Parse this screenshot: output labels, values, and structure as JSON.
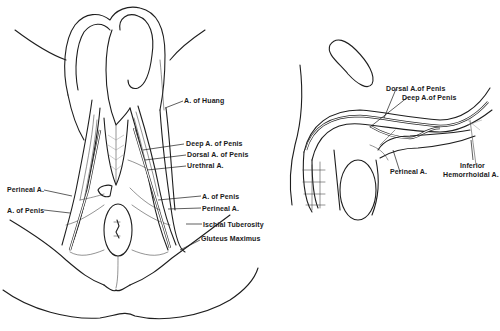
{
  "figure": {
    "background": "#ffffff",
    "ink_color": "#1e1e1e",
    "left_panel": {
      "view": "perineal view",
      "labels": [
        {
          "id": "a-of-huang",
          "text": "A. of Huang"
        },
        {
          "id": "deep-a-of-penis",
          "text": "Deep A. of Penis"
        },
        {
          "id": "dorsal-a-of-penis",
          "text": "Dorsal A. of Penis"
        },
        {
          "id": "urethral-a",
          "text": "Urethral A."
        },
        {
          "id": "perineal-a-left",
          "text": "Perineal A."
        },
        {
          "id": "a-of-penis-left",
          "text": "A. of Penis"
        },
        {
          "id": "a-of-penis-right",
          "text": "A. of Penis"
        },
        {
          "id": "perineal-a-right",
          "text": "Perineal A."
        },
        {
          "id": "ischial-tuberosity",
          "text": "Ischial Tuberosity"
        },
        {
          "id": "gluteus-maximus",
          "text": "Gluteus Maximus"
        }
      ]
    },
    "right_panel": {
      "view": "lateral view",
      "labels": [
        {
          "id": "dorsal-a-of-penis",
          "text": "Dorsal A.of Penis"
        },
        {
          "id": "deep-a-of-penis",
          "text": "Deep A.of Penis"
        },
        {
          "id": "perineal-a",
          "text": "Perineal A."
        },
        {
          "id": "inferior-hemorrhoidal-a-line1",
          "text": "Inferior"
        },
        {
          "id": "inferior-hemorrhoidal-a-line2",
          "text": "Hemorrhoidal A."
        }
      ]
    }
  }
}
